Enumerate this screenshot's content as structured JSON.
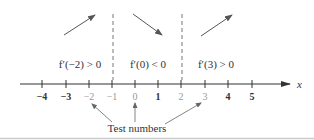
{
  "diagram": {
    "axis": {
      "label": "x",
      "ticks": [
        "-4",
        "-3",
        "-2",
        "-1",
        "0",
        "1",
        "2",
        "3",
        "4",
        "5"
      ],
      "tick_display": [
        "−4",
        "−3",
        "−2",
        "−1",
        "0",
        "1",
        "2",
        "3",
        "4",
        "5"
      ]
    },
    "critical_points": [
      "-1",
      "2"
    ],
    "intervals": [
      {
        "condition": "f′(−2) > 0",
        "direction": "increasing",
        "arrow": "arrow-up-right"
      },
      {
        "condition": "f′(0) < 0",
        "direction": "decreasing",
        "arrow": "arrow-down-right"
      },
      {
        "condition": "f′(3) > 0",
        "direction": "increasing",
        "arrow": "arrow-up-right"
      }
    ],
    "test_numbers": {
      "label": "Test numbers",
      "values": [
        "-2",
        "0",
        "3"
      ]
    },
    "colors": {
      "ink": "#333333",
      "arrow": "#555555",
      "dashed": "#777777",
      "baseline": "#cccccc"
    }
  }
}
